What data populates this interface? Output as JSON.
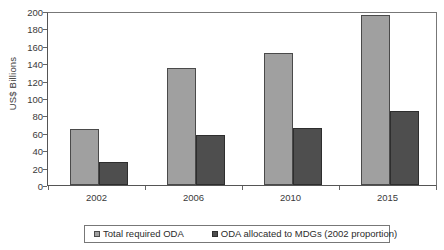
{
  "chart_data": {
    "type": "bar",
    "title": "",
    "subtitle": "",
    "xlabel": "",
    "ylabel": "US$ Billions",
    "categories": [
      "2002",
      "2006",
      "2010",
      "2015"
    ],
    "series": [
      {
        "name": "Total required ODA",
        "color": "#a0a0a0",
        "values": [
          64,
          135,
          152,
          195
        ]
      },
      {
        "name": "ODA allocated to MDGs (2002 proportion)",
        "color": "#4e4e4e",
        "values": [
          27,
          58,
          65,
          85
        ]
      }
    ],
    "ylim": [
      0,
      200
    ],
    "yticks": [
      0,
      20,
      40,
      60,
      80,
      100,
      120,
      140,
      160,
      180,
      200
    ],
    "ytick_labels": [
      "0",
      "20",
      "40",
      "60",
      "80",
      "100",
      "120",
      "140",
      "160",
      "180",
      "200"
    ],
    "grid": false,
    "legend_position": "bottom"
  }
}
